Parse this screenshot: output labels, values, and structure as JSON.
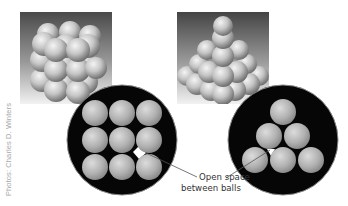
{
  "figure": {
    "photo_left": {
      "subject": "simple cubic stacking of spheres",
      "layers": 3,
      "per_layer": "3x3"
    },
    "photo_right": {
      "subject": "pyramid stacking of spheres"
    },
    "diagram_left": {
      "arrangement": "square",
      "rows": 3,
      "cols": 3,
      "background": "#000000",
      "ball_color": "#b8b8b8"
    },
    "diagram_right": {
      "arrangement": "triangular",
      "rows": [
        1,
        2,
        3
      ],
      "background": "#000000",
      "ball_color": "#b8b8b8"
    },
    "annotation": {
      "line1": "Open space",
      "line2": "between balls"
    },
    "credit": "Photos: Charles D. Winters"
  }
}
